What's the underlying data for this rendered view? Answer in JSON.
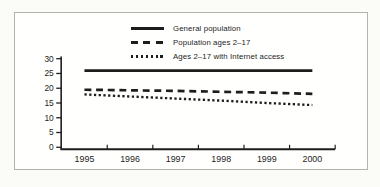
{
  "figure": {
    "ink_color": "#1d1d1d",
    "frame_border_color": "#b3b3ab",
    "background": "#fbfbf8"
  },
  "chart_data": {
    "type": "line",
    "title": "",
    "xlabel": "",
    "ylabel": "",
    "categories": [
      "1995",
      "1996",
      "1997",
      "1998",
      "1999",
      "2000"
    ],
    "ylim": [
      0,
      30
    ],
    "yticks": [
      0,
      5,
      10,
      15,
      20,
      25,
      30
    ],
    "grid": false,
    "legend_position": "top-center-inside",
    "series": [
      {
        "name": "General population",
        "style": "solid",
        "values": [
          26,
          26,
          26,
          26,
          26,
          26
        ]
      },
      {
        "name": "Population ages 2–17",
        "style": "dashed",
        "values": [
          19.5,
          19.3,
          19.1,
          18.8,
          18.5,
          18.1
        ]
      },
      {
        "name": "Ages 2–17 with Internet access",
        "style": "dotted",
        "values": [
          17.9,
          17.2,
          16.5,
          15.8,
          15.0,
          14.3
        ]
      }
    ]
  }
}
